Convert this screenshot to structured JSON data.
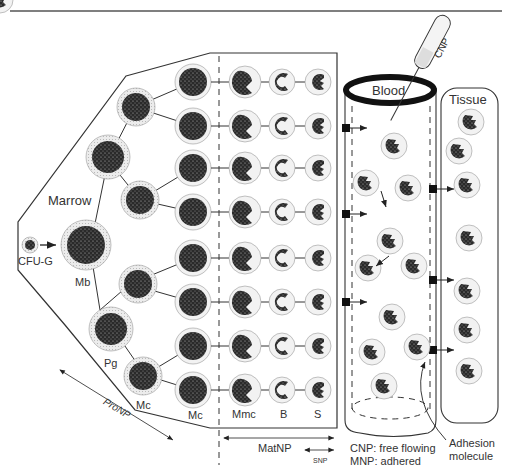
{
  "diagram": {
    "regions": {
      "marrow": "Marrow",
      "blood": "Blood",
      "tissue": "Tissue"
    },
    "cell_labels": {
      "cfu_g": "CFU-G",
      "mb": "Mb",
      "pg": "Pg",
      "mc_small": "Mc",
      "mc": "Mc",
      "mmc": "Mmc",
      "b": "B",
      "s": "S"
    },
    "pools": {
      "pro_np": "ProNP",
      "mat_np": "MatNP",
      "snp": "SNP"
    },
    "syringe_label": "CNP",
    "legend": {
      "line1": "CNP: free flowing",
      "line2": "MNP: adhered"
    },
    "callout": {
      "line1": "Adhesion",
      "line2": "molecule"
    },
    "colors": {
      "line": "#222222",
      "nucleus": "#2a2a2a",
      "cytoplasm": "#e6e6e6",
      "text": "#333333"
    }
  }
}
